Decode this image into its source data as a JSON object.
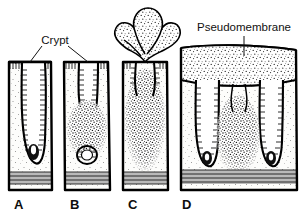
{
  "figure": {
    "background_color": "#ffffff",
    "ink_color": "#000000",
    "muscle_band_color": "#b9b9b9"
  },
  "annotations": [
    {
      "id": "crypt",
      "label": "Crypt",
      "x": 55,
      "y": 41,
      "leaders": 2
    },
    {
      "id": "pseudomembrane",
      "label": "Pseudomembrane",
      "x": 244,
      "y": 28,
      "leaders": 1
    }
  ],
  "panels": [
    {
      "letter": "A",
      "letter_x": 14,
      "letter_y": 209,
      "stage": "normal mucosa with intact crypt",
      "x": 8,
      "width": 44,
      "exudate": "none"
    },
    {
      "letter": "B",
      "letter_x": 70,
      "letter_y": 209,
      "stage": "early lesion with focal exudate at crypt base",
      "x": 63,
      "width": 47,
      "exudate": "focal"
    },
    {
      "letter": "C",
      "letter_x": 128,
      "letter_y": 209,
      "stage": "volcano lesion erupting exudate plume",
      "x": 122,
      "width": 46,
      "exudate": "erupting"
    },
    {
      "letter": "D",
      "letter_x": 182,
      "letter_y": 209,
      "stage": "confluent pseudomembrane over mucosal surface",
      "x": 180,
      "width": 117,
      "exudate": "confluent"
    }
  ]
}
